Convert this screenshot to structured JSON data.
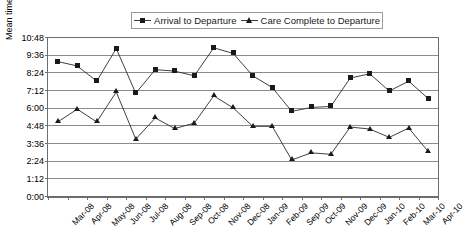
{
  "chart_data": {
    "type": "line",
    "title": "",
    "xlabel": "",
    "ylabel": "Mean time hh:mm",
    "grid": true,
    "legend_position": "top",
    "ylim": [
      "0:00",
      "10:48"
    ],
    "ytick_labels": [
      "10:48",
      "9:36",
      "8:24",
      "7:12",
      "6:00",
      "4:48",
      "3:36",
      "2:24",
      "1:12",
      "0:00"
    ],
    "ytick_values": [
      648,
      576,
      504,
      432,
      360,
      288,
      216,
      144,
      72,
      0
    ],
    "ytick_interval_minutes": 72,
    "categories": [
      "Mar-08",
      "Apr-08",
      "May-08",
      "Jun-08",
      "Jul-08",
      "Aug-08",
      "Sep-08",
      "Oct-08",
      "Nov-08",
      "Dec-08",
      "Jan-09",
      "Feb-09",
      "Sep-09",
      "Oct-09",
      "Nov-09",
      "Dec-09",
      "Jan-10",
      "Feb-10",
      "Mar-10",
      "Apr-10"
    ],
    "series": [
      {
        "name": "Arrival to Departure",
        "marker": "square",
        "values_hhmm": [
          "9:12",
          "8:54",
          "7:52",
          "10:05",
          "7:03",
          "8:39",
          "8:33",
          "8:14",
          "10:08",
          "9:45",
          "8:14",
          "7:26",
          "5:49",
          "6:05",
          "6:09",
          "8:05",
          "8:22",
          "7:12",
          "7:52",
          "6:41"
        ],
        "values_minutes": [
          552,
          534,
          472,
          605,
          423,
          519,
          513,
          494,
          608,
          585,
          494,
          446,
          349,
          365,
          369,
          485,
          502,
          432,
          472,
          401
        ]
      },
      {
        "name": "Care Complete to Departure",
        "marker": "triangle",
        "values_hhmm": [
          "5:06",
          "5:58",
          "5:06",
          "7:08",
          "3:56",
          "5:22",
          "4:39",
          "5:01",
          "6:52",
          "6:03",
          "4:48",
          "4:48",
          "2:31",
          "3:00",
          "2:54",
          "4:45",
          "4:37",
          "4:03",
          "4:41",
          "3:05"
        ],
        "values_minutes": [
          306,
          358,
          306,
          428,
          236,
          322,
          279,
          301,
          412,
          363,
          288,
          288,
          151,
          180,
          174,
          285,
          277,
          243,
          281,
          185
        ]
      }
    ]
  },
  "legend": {
    "entries": [
      {
        "label": "Arrival to Departure",
        "marker": "square-marker-icon"
      },
      {
        "label": "Care Complete to Departure",
        "marker": "triangle-marker-icon"
      }
    ]
  },
  "axes": {
    "y_title": "Mean time hh:mm"
  }
}
